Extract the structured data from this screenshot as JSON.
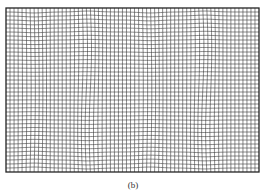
{
  "figure": {
    "caption": "(b)",
    "mesh": {
      "left": 6,
      "top": 8,
      "right": 259,
      "bottom": 172,
      "columns": 63,
      "rows": 41,
      "line_color": "#3a3a3a",
      "border_color": "#222222",
      "distortion_bands_x": [
        34,
        88,
        150,
        205
      ]
    }
  }
}
